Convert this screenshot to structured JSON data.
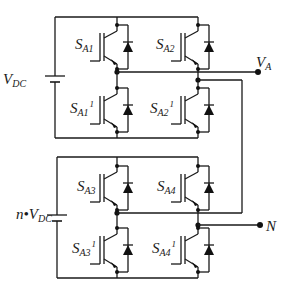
{
  "diagram": {
    "type": "cascaded H-bridge inverter leg (circuit schematic)",
    "sources": [
      {
        "id": "vdc",
        "label": "V",
        "sub": "DC",
        "prefix": ""
      },
      {
        "id": "nvdc",
        "label": "V",
        "sub": "DC",
        "prefix": "n•"
      }
    ],
    "switches": [
      {
        "id": "sa1",
        "label": "S",
        "sub": "A1",
        "sup": ""
      },
      {
        "id": "sa2",
        "label": "S",
        "sub": "A2",
        "sup": ""
      },
      {
        "id": "sa1p",
        "label": "S",
        "sub": "A1",
        "sup": "1"
      },
      {
        "id": "sa2p",
        "label": "S",
        "sub": "A2",
        "sup": "1"
      },
      {
        "id": "sa3",
        "label": "S",
        "sub": "A3",
        "sup": ""
      },
      {
        "id": "sa4",
        "label": "S",
        "sub": "A4",
        "sup": ""
      },
      {
        "id": "sa3p",
        "label": "S",
        "sub": "A3",
        "sup": "1"
      },
      {
        "id": "sa4p",
        "label": "S",
        "sub": "A4",
        "sup": "1"
      }
    ],
    "terminals": [
      {
        "id": "va",
        "label": "V",
        "sub": "A"
      },
      {
        "id": "n",
        "label": "N",
        "sub": ""
      }
    ],
    "colors": {
      "line": "#1a1a1a",
      "background": "#ffffff"
    }
  }
}
